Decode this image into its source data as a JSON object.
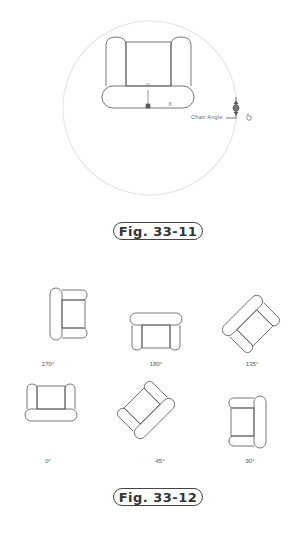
{
  "figure_1": {
    "caption": "Fig. 33-11",
    "parameter_label": "Chair Angle",
    "ucs": {
      "y_label": "Y",
      "x_label": "X"
    },
    "rotate_icon": "rotate-grip-icon"
  },
  "figure_2": {
    "caption": "Fig. 33-12",
    "chairs": [
      {
        "angle": 270,
        "label": "270°"
      },
      {
        "angle": 180,
        "label": "180°"
      },
      {
        "angle": 135,
        "label": "135°"
      },
      {
        "angle": 0,
        "label": "0°"
      },
      {
        "angle": 45,
        "label": "45°"
      },
      {
        "angle": 90,
        "label": "90°"
      }
    ]
  },
  "colors": {
    "line": "#555555",
    "circle": "#e6e6e6",
    "caption_border": "#444444"
  }
}
